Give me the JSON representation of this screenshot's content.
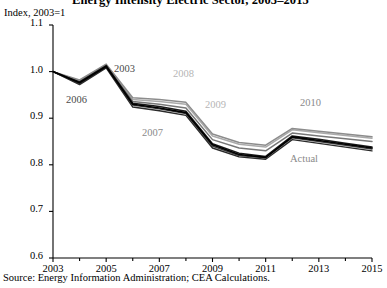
{
  "figure": {
    "title": "Energy Intensity Electric Sector, 2003–2015",
    "y_unit_label": "Index, 2003=1",
    "source": "Source: Energy Information Administration; CEA Calculations."
  },
  "axes": {
    "y_ticks": [
      "1.1",
      "1.0",
      "0.9",
      "0.8",
      "0.7",
      "0.6"
    ],
    "x_ticks": [
      "2003",
      "2005",
      "2007",
      "2009",
      "2011",
      "2013",
      "2015"
    ]
  },
  "annotations": {
    "a2003": "2003",
    "a2006": "2006",
    "a2007": "2007",
    "a2008": "2008",
    "a2009": "2009",
    "a2010": "2010",
    "actual": "Actual"
  },
  "colors": {
    "axis": "#000000",
    "aeo2003": "#1a1a1a",
    "aeo2006": "#3d3d3d",
    "aeo2007": "#2b2b2b",
    "aeo2008": "#8c8c8c",
    "aeo2009": "#aaaaaa",
    "aeo2010": "#777777",
    "actual": "#000000",
    "label_light": "#b5b5b5",
    "label_mid": "#8a8a8a",
    "label_dark": "#4a4a4a"
  },
  "chart_data": {
    "type": "line",
    "title": "Energy Intensity Electric Sector, 2003–2015",
    "xlabel": "",
    "ylabel": "Index, 2003=1",
    "xlim": [
      2003,
      2015
    ],
    "ylim": [
      0.6,
      1.1
    ],
    "grid": false,
    "legend": "inline annotations on lines",
    "x": [
      2003,
      2004,
      2005,
      2006,
      2007,
      2008,
      2009,
      2010,
      2011,
      2012,
      2013,
      2014,
      2015
    ],
    "series": [
      {
        "name": "2003",
        "color": "#1a1a1a",
        "values": [
          1.0,
          0.978,
          1.013,
          0.932,
          0.925,
          0.915,
          0.845,
          0.825,
          0.818,
          0.862,
          0.855,
          0.846,
          0.838
        ]
      },
      {
        "name": "2006",
        "color": "#3d3d3d",
        "values": [
          1.0,
          0.974,
          1.01,
          0.928,
          0.92,
          0.91,
          0.84,
          0.82,
          0.815,
          0.858,
          0.85,
          0.842,
          0.834
        ]
      },
      {
        "name": "2007",
        "color": "#2b2b2b",
        "values": [
          1.0,
          0.972,
          1.008,
          0.924,
          0.916,
          0.906,
          0.836,
          0.817,
          0.812,
          0.854,
          0.846,
          0.838,
          0.83
        ]
      },
      {
        "name": "2008",
        "color": "#8c8c8c",
        "values": [
          1.0,
          0.982,
          1.016,
          0.944,
          0.94,
          0.934,
          0.866,
          0.848,
          0.842,
          0.878,
          0.872,
          0.866,
          0.86
        ]
      },
      {
        "name": "2009",
        "color": "#aaaaaa",
        "values": [
          1.0,
          0.98,
          1.015,
          0.94,
          0.936,
          0.93,
          0.862,
          0.844,
          0.838,
          0.875,
          0.869,
          0.863,
          0.857
        ]
      },
      {
        "name": "2010",
        "color": "#777777",
        "values": [
          1.0,
          0.976,
          1.012,
          0.936,
          0.93,
          0.922,
          0.854,
          0.836,
          0.83,
          0.868,
          0.862,
          0.856,
          0.85
        ]
      },
      {
        "name": "Actual",
        "color": "#000000",
        "values": [
          1.0,
          0.976,
          1.011,
          0.93,
          0.922,
          0.912,
          0.843,
          0.822,
          0.816,
          0.86,
          0.852,
          0.844,
          0.836
        ]
      }
    ]
  }
}
